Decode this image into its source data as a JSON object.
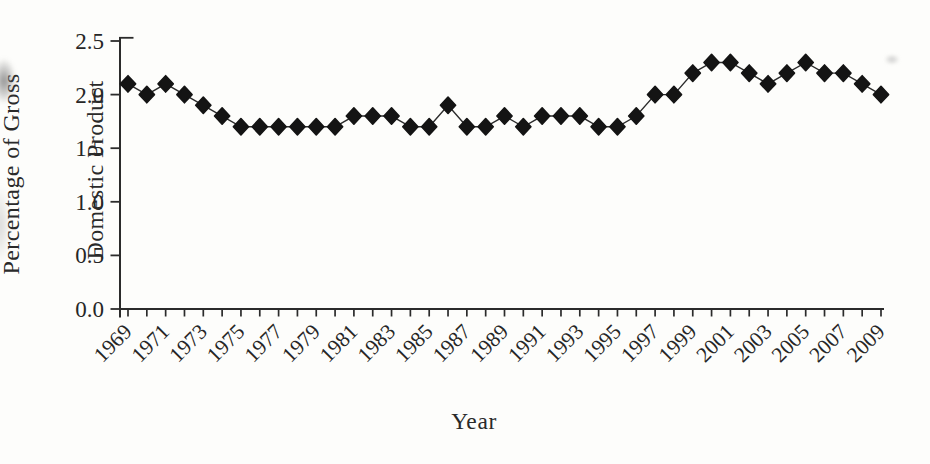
{
  "page": {
    "background_color": "#fdfdfb",
    "ink_color": "#262626"
  },
  "chart_data": {
    "type": "line",
    "title": "",
    "xlabel": "Year",
    "ylabel": "Percentage of Gross Domestic Product",
    "ylabel_line1": "Percentage of Gross",
    "ylabel_line2": "Domestic Product",
    "marker": "diamond",
    "line_color": "#2b2b2b",
    "marker_color": "#141414",
    "grid": false,
    "legend": null,
    "ylim": [
      0.0,
      2.5
    ],
    "yticks": [
      "0.0",
      "0.5",
      "1.0",
      "1.5",
      "2.0",
      "2.5"
    ],
    "xtick_label_years": [
      1969,
      1971,
      1973,
      1975,
      1977,
      1979,
      1981,
      1983,
      1985,
      1987,
      1989,
      1991,
      1993,
      1995,
      1997,
      1999,
      2001,
      2003,
      2005,
      2007,
      2009
    ],
    "x": [
      1969,
      1970,
      1971,
      1972,
      1973,
      1974,
      1975,
      1976,
      1977,
      1978,
      1979,
      1980,
      1981,
      1982,
      1983,
      1984,
      1985,
      1986,
      1987,
      1988,
      1989,
      1990,
      1991,
      1992,
      1993,
      1994,
      1995,
      1996,
      1997,
      1998,
      1999,
      2000,
      2001,
      2002,
      2003,
      2004,
      2005,
      2006,
      2007,
      2008,
      2009
    ],
    "values": [
      2.1,
      2.0,
      2.1,
      2.0,
      1.9,
      1.8,
      1.7,
      1.7,
      1.7,
      1.7,
      1.7,
      1.7,
      1.8,
      1.8,
      1.8,
      1.7,
      1.7,
      1.9,
      1.7,
      1.7,
      1.8,
      1.7,
      1.8,
      1.8,
      1.8,
      1.7,
      1.7,
      1.8,
      2.0,
      2.0,
      2.2,
      2.3,
      2.3,
      2.2,
      2.1,
      2.2,
      2.3,
      2.2,
      2.2,
      2.1,
      2.0
    ]
  }
}
